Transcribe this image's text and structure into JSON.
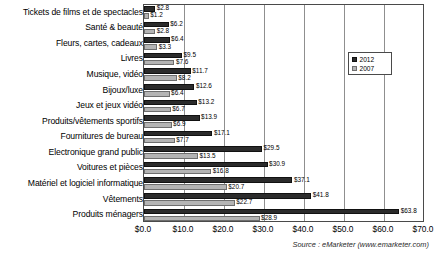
{
  "chart_data": {
    "type": "bar",
    "orientation": "horizontal",
    "title": "",
    "xlabel": "",
    "ylabel": "",
    "xlim": [
      0,
      70
    ],
    "xticks": [
      "$0.0",
      "$10.0",
      "$20.0",
      "$30.0",
      "$40.0",
      "$50.0",
      "$60.0",
      "$70.0"
    ],
    "xtick_values": [
      0,
      10,
      20,
      30,
      40,
      50,
      60,
      70
    ],
    "grid": true,
    "grid_axis": "x",
    "legend_position": "upper right",
    "categories": [
      "Tickets de films et de spectacles",
      "Santé & beauté",
      "Fleurs, cartes, cadeaux",
      "Livres",
      "Musique, vidéo",
      "Bijoux/luxe",
      "Jeux et jeux vidéo",
      "Produits/vêtements  sportifs",
      "Fournitures de bureau",
      "Electronique grand public",
      "Voitures et pièces",
      "Matériel et logiciel informatique",
      "Vêtements",
      "Produits ménagers"
    ],
    "series": [
      {
        "name": "2012",
        "color": "#2b2b2b",
        "values": [
          2.8,
          6.2,
          6.4,
          9.5,
          11.7,
          12.6,
          13.2,
          13.9,
          17.1,
          29.5,
          30.9,
          37.1,
          41.8,
          63.8
        ],
        "labels": [
          "$2.8",
          "$6.2",
          "$6.4",
          "$9.5",
          "$11.7",
          "$12.6",
          "$13.2",
          "$13.9",
          "$17.1",
          "$29.5",
          "$30.9",
          "$37.1",
          "$41.8",
          "$63.8"
        ]
      },
      {
        "name": "2007",
        "color": "#b4b4b4",
        "values": [
          1.2,
          2.8,
          3.3,
          7.6,
          8.2,
          6.4,
          6.7,
          6.9,
          7.7,
          13.5,
          16.8,
          20.7,
          22.7,
          28.9
        ],
        "labels": [
          "$1.2",
          "$2.8",
          "$3.3",
          "$7.6",
          "$8.2",
          "$6.4",
          "$6.7",
          "$6.9",
          "$7.7",
          "$13.5",
          "$16.8",
          "$20.7",
          "$22.7",
          "$28.9"
        ]
      }
    ]
  },
  "legend": {
    "items": [
      {
        "label": "2012"
      },
      {
        "label": "2007"
      }
    ]
  },
  "source": {
    "text": "Source : eMarketer (www.emarketer.com)"
  }
}
